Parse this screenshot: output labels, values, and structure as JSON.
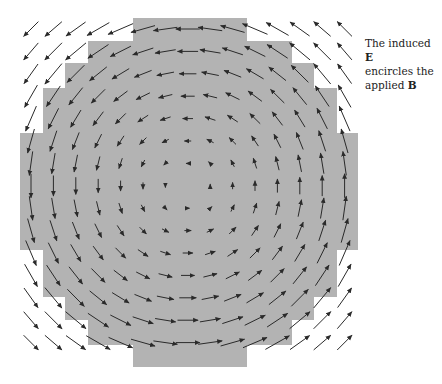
{
  "caption": {
    "line1_prefix": "The induced ",
    "line1_bold": "E",
    "line2": "encircles the",
    "line3_prefix": "applied ",
    "line3_bold": "B"
  },
  "figure": {
    "region_color": "#b3b3b3",
    "arrow_color": "#2a2a2a",
    "background": "#ffffff",
    "grid": {
      "cols": 15,
      "rows": 15,
      "x0": 31,
      "y0": 29,
      "spacing": 22.4,
      "center_x": 188,
      "center_y": 186
    },
    "rotation": "counterclockwise",
    "field_region_radius": 170,
    "region_outline": [
      [
        133,
        18
      ],
      [
        247,
        18
      ],
      [
        247,
        41
      ],
      [
        292,
        41
      ],
      [
        292,
        63
      ],
      [
        314,
        63
      ],
      [
        314,
        88
      ],
      [
        337,
        88
      ],
      [
        337,
        133
      ],
      [
        358,
        133
      ],
      [
        358,
        250
      ],
      [
        337,
        250
      ],
      [
        337,
        297
      ],
      [
        314,
        297
      ],
      [
        314,
        320
      ],
      [
        292,
        320
      ],
      [
        292,
        345
      ],
      [
        247,
        345
      ],
      [
        247,
        367
      ],
      [
        133,
        367
      ],
      [
        133,
        345
      ],
      [
        88,
        345
      ],
      [
        88,
        320
      ],
      [
        65,
        320
      ],
      [
        65,
        297
      ],
      [
        43,
        297
      ],
      [
        43,
        250
      ],
      [
        20,
        250
      ],
      [
        20,
        133
      ],
      [
        43,
        133
      ],
      [
        43,
        88
      ],
      [
        65,
        88
      ],
      [
        65,
        63
      ],
      [
        88,
        63
      ],
      [
        88,
        41
      ],
      [
        133,
        41
      ]
    ]
  }
}
